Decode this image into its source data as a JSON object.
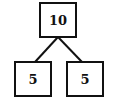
{
  "diagram": {
    "type": "number-bond",
    "whole": {
      "value": "10"
    },
    "parts": [
      {
        "value": "5"
      },
      {
        "value": "5"
      }
    ],
    "colors": {
      "stroke": "#111111",
      "background": "#ffffff"
    }
  }
}
